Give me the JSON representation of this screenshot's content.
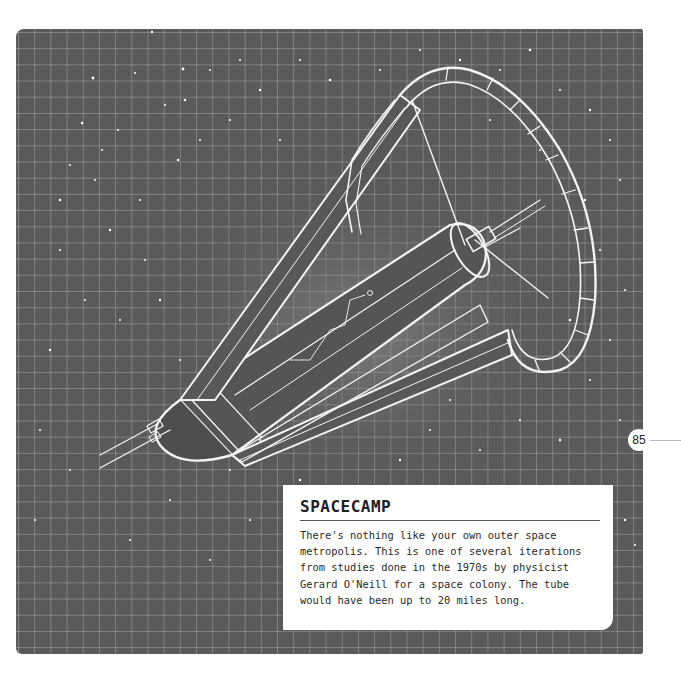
{
  "page": {
    "number": "85"
  },
  "caption": {
    "title": "SPACECAMP",
    "body": "There's nothing like your own outer space\nmetropolis. This is one of several iterations\nfrom studies done in the 1970s by physicist\nGerard O'Neill for a space colony. The tube\nwould have been up to 20 miles long."
  },
  "illustration": {
    "subject": "O'Neill space colony cylinder with ring and solar mirrors",
    "style": "white line drawing on dark grid starfield",
    "colors": {
      "panel": "#5a5a5a",
      "grid": "#c8c8c8",
      "lines": "#f4f4f4",
      "caption_bg": "#ffffff",
      "text": "#222222"
    }
  }
}
